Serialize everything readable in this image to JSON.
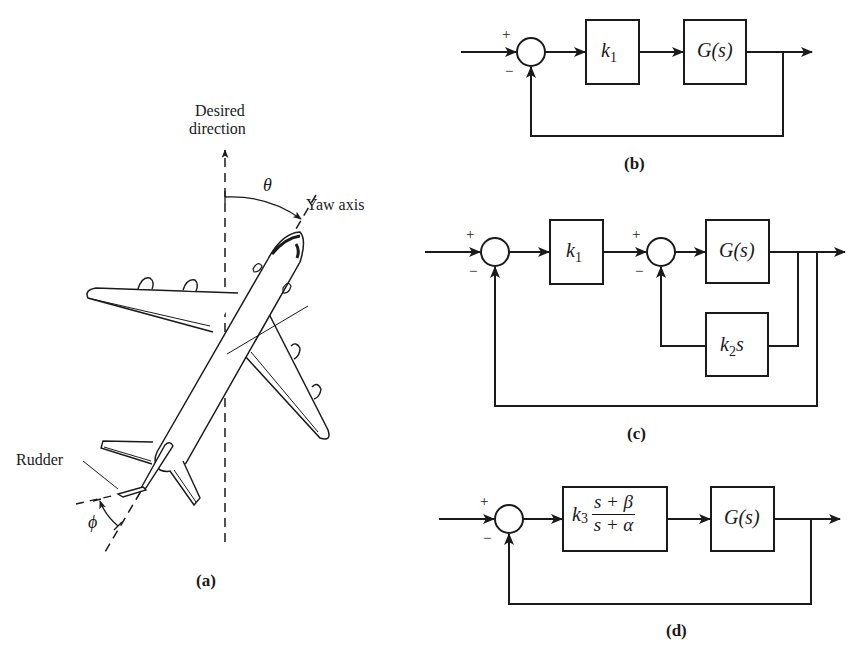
{
  "figure_a": {
    "label_desired": "Desired",
    "label_direction": "direction",
    "label_theta": "θ",
    "label_yaw": "Yaw axis",
    "label_rudder": "Rudder",
    "label_phi": "ϕ",
    "caption": "(a)"
  },
  "figure_b": {
    "sum_plus": "+",
    "sum_minus": "−",
    "block1_main": "k",
    "block1_sub": "1",
    "block2": "G(s)",
    "caption": "(b)"
  },
  "figure_c": {
    "sum1_plus": "+",
    "sum1_minus": "−",
    "sum2_plus": "+",
    "sum2_minus": "−",
    "block1_main": "k",
    "block1_sub": "1",
    "block2": "G(s)",
    "feedback_main": "k",
    "feedback_sub": "2",
    "feedback_tail": "s",
    "caption": "(c)"
  },
  "figure_d": {
    "sum_plus": "+",
    "sum_minus": "−",
    "comp_main": "k",
    "comp_sub": "3",
    "comp_num": "s + β",
    "comp_den": "s + α",
    "block2": "G(s)",
    "caption": "(d)"
  }
}
